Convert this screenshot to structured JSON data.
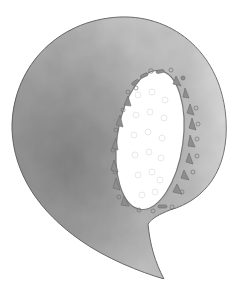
{
  "illustration": {
    "subject": "Watercolor letter Q",
    "letter": "Q",
    "colors": {
      "background": "#ffffff",
      "wash_light": "#d9d9d9",
      "wash_mid": "#b3b3b3",
      "wash_dark": "#8c8c8c",
      "outline": "#6e6e6e",
      "hole": "#ffffff",
      "beads": "#8a8a8a"
    }
  }
}
